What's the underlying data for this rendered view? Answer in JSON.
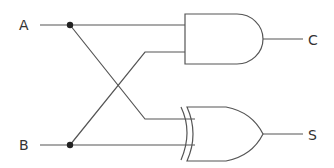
{
  "diagram": {
    "type": "half-adder logic circuit",
    "inputs": [
      {
        "label": "A"
      },
      {
        "label": "B"
      }
    ],
    "outputs": [
      {
        "label": "C",
        "gate": "AND"
      },
      {
        "label": "S",
        "gate": "XOR"
      }
    ],
    "gates": [
      {
        "type": "AND",
        "inputs": [
          "A",
          "B"
        ],
        "output": "C"
      },
      {
        "type": "XOR",
        "inputs": [
          "A",
          "B"
        ],
        "output": "S"
      }
    ],
    "colors": {
      "wire": "#555555",
      "text": "#333333",
      "junction": "#222222"
    }
  }
}
